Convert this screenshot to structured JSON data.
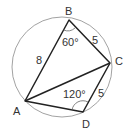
{
  "diagram": {
    "type": "cyclic-quadrilateral",
    "vertices": {
      "A": {
        "label": "A",
        "x": 25,
        "y": 101
      },
      "B": {
        "label": "B",
        "x": 69,
        "y": 20
      },
      "C": {
        "label": "C",
        "x": 110,
        "y": 63
      },
      "D": {
        "label": "D",
        "x": 83,
        "y": 112
      }
    },
    "circle": {
      "cx": 62,
      "cy": 67,
      "r": 50
    },
    "side_labels": {
      "AB": "8",
      "BC": "5",
      "CD": "5"
    },
    "angle_labels": {
      "B": "60°",
      "D": "120°"
    },
    "colors": {
      "lines": "#222222",
      "circle": "#888888",
      "text": "#333333"
    }
  }
}
